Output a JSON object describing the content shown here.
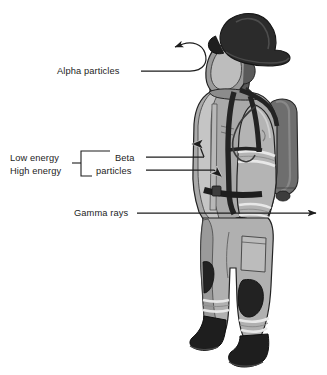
{
  "figure": {
    "background_color": "#ffffff",
    "line_color": "#1d1d1d"
  },
  "labels": {
    "alpha": "Alpha particles",
    "low_energy": "Low energy",
    "high_energy": "High energy",
    "beta_line1": "Beta",
    "beta_line2": "particles",
    "gamma": "Gamma rays"
  },
  "annotations": [
    {
      "name": "alpha-particles",
      "label": "Alpha particles",
      "behavior": "deflected",
      "arrow": "curved-hook-reversing-to-left",
      "penetration": "none"
    },
    {
      "name": "beta-particles-low-energy",
      "label": "Low energy",
      "group": "Beta particles",
      "behavior": "stopped-at-outer-shell",
      "arrow": "straight-right-short",
      "penetration": "partial-outer"
    },
    {
      "name": "beta-particles-high-energy",
      "label": "High energy",
      "group": "Beta particles",
      "behavior": "stopped-inside-garment",
      "arrow": "straight-right-medium",
      "penetration": "partial-inner"
    },
    {
      "name": "gamma-rays",
      "label": "Gamma rays",
      "behavior": "passes-through",
      "arrow": "straight-right-through-and-exit",
      "penetration": "full"
    }
  ],
  "palette": {
    "suit_mid": "#a9a9a9",
    "suit_light": "#c9c9c9",
    "suit_lighter": "#dcdcdc",
    "suit_shadow": "#8d8d8d",
    "dark": "#2b2b2b",
    "darker": "#1c1c1c",
    "tank": "#6e6e6e",
    "outline": "#2a2a2a",
    "stripe": "#e6e6e6"
  },
  "figure_parts": [
    "helmet",
    "scba-mask",
    "hood",
    "turnout-coat",
    "reflective-stripes",
    "shoulder-harness-straps",
    "waist-belt",
    "scba-air-tank",
    "regulator-hose",
    "glove",
    "turnout-pants",
    "knee-pads",
    "boots"
  ]
}
